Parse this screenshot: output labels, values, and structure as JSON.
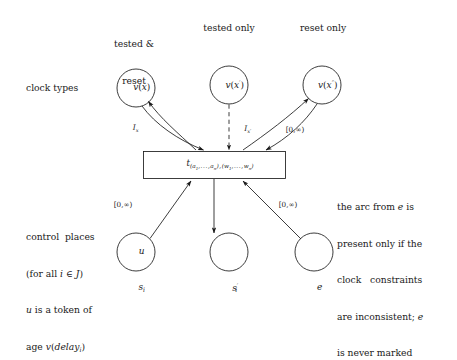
{
  "figure": {
    "background": "#ffffff",
    "stroke_color": "#1a1a1a"
  },
  "headers": {
    "tested_and_reset_line1": "tested &",
    "tested_and_reset_line2": "reset",
    "tested_only": "tested only",
    "reset_only": "reset only"
  },
  "row_labels": {
    "clock_types": "clock types"
  },
  "clock_places": [
    {
      "id": "vx",
      "label_v": "v",
      "label_arg": "(x)",
      "name": "v(x)"
    },
    {
      "id": "vxp",
      "label_v": "v",
      "label_arg": "(x')",
      "name": "v(x')"
    },
    {
      "id": "vxpp",
      "label_v": "v",
      "label_arg": "(x'')",
      "name": "v(x'')"
    }
  ],
  "transition": {
    "label_base": "t",
    "label_sub": "(a1,...,an),(w1,...,wn)"
  },
  "control_places": [
    {
      "id": "si",
      "token": "u",
      "name": "s_i",
      "has_token_label": true
    },
    {
      "id": "sip",
      "token": "",
      "name": "s'_i",
      "has_token_label": false
    },
    {
      "id": "e",
      "token": "",
      "name": "e",
      "has_token_label": false
    }
  ],
  "arc_labels": {
    "left_clock": "I_x",
    "middle_clock": "I_x'",
    "right_clock": "[0,∞)",
    "left_control": "[0,∞)",
    "right_control": "[0,∞)"
  },
  "notes": {
    "control_places": [
      "control  places",
      "(for all i ∈ J)",
      "u is a token of",
      "age v(delay_i)"
    ],
    "arc_from_e": [
      "the arc from e is",
      "present only if the",
      "clock   constraints",
      "are inconsistent; e",
      "is never marked"
    ]
  }
}
